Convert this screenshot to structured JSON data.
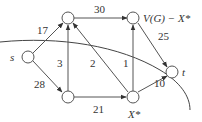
{
  "diagram": {
    "type": "flow-network-cut",
    "nodes": [
      {
        "id": "s",
        "label": "s"
      },
      {
        "id": "a",
        "label": ""
      },
      {
        "id": "b",
        "label": "V(G) − X*"
      },
      {
        "id": "c",
        "label": ""
      },
      {
        "id": "x",
        "label": "X*"
      },
      {
        "id": "t",
        "label": "t"
      }
    ],
    "edges": [
      {
        "from": "s",
        "to": "a",
        "label": "17"
      },
      {
        "from": "s",
        "to": "c",
        "label": "28"
      },
      {
        "from": "a",
        "to": "b",
        "label": "30"
      },
      {
        "from": "c",
        "to": "a",
        "label": "3"
      },
      {
        "from": "x",
        "to": "a",
        "label": "2"
      },
      {
        "from": "x",
        "to": "b",
        "label": "1"
      },
      {
        "from": "c",
        "to": "x",
        "label": "21"
      },
      {
        "from": "b",
        "to": "t",
        "label": "25"
      },
      {
        "from": "x",
        "to": "t",
        "label": "10"
      }
    ],
    "cut_curve": "separates X* from V(G) − X*"
  }
}
